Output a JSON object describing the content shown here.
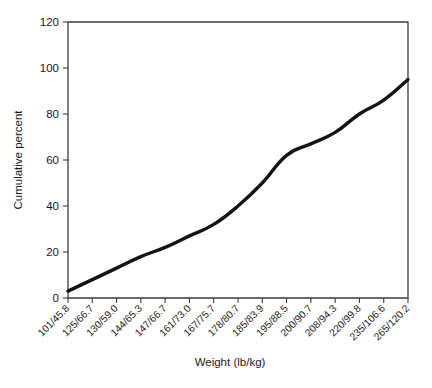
{
  "chart_data": {
    "type": "line",
    "title": "",
    "xlabel": "Weight (lb/kg)",
    "ylabel": "Cumulative percent",
    "categories": [
      "101/45.8",
      "125/66.7",
      "130/59.0",
      "144/65.3",
      "147/66.7",
      "161/73.0",
      "167/75.7",
      "178/80.7",
      "185/83.9",
      "195/88.5",
      "200/90.7",
      "208/94.3",
      "220/99.8",
      "235/106.6",
      "265/120.2"
    ],
    "values": [
      3,
      8,
      13,
      18,
      22,
      27,
      32,
      40,
      50,
      62,
      67,
      72,
      80,
      86,
      95
    ],
    "yticks": [
      0,
      20,
      40,
      60,
      80,
      100,
      120
    ],
    "ytick_labels": [
      "0",
      "20",
      "40",
      "60",
      "80",
      "100",
      "120"
    ],
    "ylim": [
      0,
      120
    ],
    "grid": false,
    "legend": false,
    "legend_position": "none",
    "series_color": "#141414",
    "axis_color": "#3c3c3c"
  }
}
